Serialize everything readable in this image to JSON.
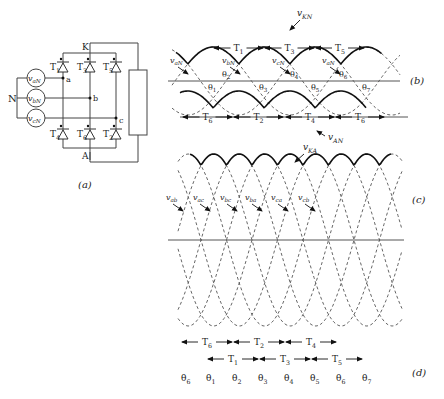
{
  "panels": {
    "a": {
      "caption": "(a)"
    },
    "b": {
      "caption": "(b)"
    },
    "c": {
      "caption": "(c)"
    },
    "d": {
      "caption": "(d)"
    }
  },
  "circuit": {
    "neutral_label": "N",
    "sources": [
      {
        "name": "v",
        "sub": "aN"
      },
      {
        "name": "v",
        "sub": "bN"
      },
      {
        "name": "v",
        "sub": "cN"
      }
    ],
    "nodes": {
      "a": "a",
      "b": "b",
      "c": "c",
      "K": "K",
      "A": "A"
    },
    "thyristors_top": [
      {
        "name": "T",
        "sub": "1"
      },
      {
        "name": "T",
        "sub": "3"
      },
      {
        "name": "T",
        "sub": "5"
      }
    ],
    "thyristors_bottom": [
      {
        "name": "T",
        "sub": "4"
      },
      {
        "name": "T",
        "sub": "6"
      },
      {
        "name": "T",
        "sub": "2"
      }
    ]
  },
  "panel_b": {
    "top_curve_label": {
      "name": "v",
      "sub": "KN"
    },
    "bottom_curve_label": {
      "name": "v",
      "sub": "AN"
    },
    "phase_labels": [
      {
        "name": "v",
        "sub": "aN"
      },
      {
        "name": "v",
        "sub": "bN"
      },
      {
        "name": "v",
        "sub": "cN"
      },
      {
        "name": "v",
        "sub": "aN"
      }
    ],
    "top_intervals": [
      {
        "name": "T",
        "sub": "1"
      },
      {
        "name": "T",
        "sub": "3"
      },
      {
        "name": "T",
        "sub": "5"
      }
    ],
    "bottom_intervals": [
      {
        "name": "T",
        "sub": "6"
      },
      {
        "name": "T",
        "sub": "2"
      },
      {
        "name": "T",
        "sub": "4"
      },
      {
        "name": "T",
        "sub": "6"
      }
    ],
    "theta_above_axis": [
      {
        "name": "θ",
        "sub": "2"
      },
      {
        "name": "θ",
        "sub": "4"
      },
      {
        "name": "θ",
        "sub": "6"
      }
    ],
    "theta_below_axis": [
      {
        "name": "θ",
        "sub": "1"
      },
      {
        "name": "θ",
        "sub": "3"
      },
      {
        "name": "θ",
        "sub": "5"
      },
      {
        "name": "θ",
        "sub": "7"
      }
    ]
  },
  "panel_c": {
    "output_label": {
      "name": "v",
      "sub": "KA"
    },
    "line_labels": [
      {
        "name": "v",
        "sub": "ab"
      },
      {
        "name": "v",
        "sub": "ac"
      },
      {
        "name": "v",
        "sub": "bc"
      },
      {
        "name": "v",
        "sub": "ba"
      },
      {
        "name": "v",
        "sub": "ca"
      },
      {
        "name": "v",
        "sub": "cb"
      }
    ]
  },
  "panel_d": {
    "row1": [
      {
        "name": "T",
        "sub": "6"
      },
      {
        "name": "T",
        "sub": "2"
      },
      {
        "name": "T",
        "sub": "4"
      }
    ],
    "row2": [
      {
        "name": "T",
        "sub": "1"
      },
      {
        "name": "T",
        "sub": "3"
      },
      {
        "name": "T",
        "sub": "5"
      }
    ],
    "thetas": [
      {
        "name": "θ",
        "sub": "6"
      },
      {
        "name": "θ",
        "sub": "1"
      },
      {
        "name": "θ",
        "sub": "2"
      },
      {
        "name": "θ",
        "sub": "3"
      },
      {
        "name": "θ",
        "sub": "4"
      },
      {
        "name": "θ",
        "sub": "5"
      },
      {
        "name": "θ",
        "sub": "6"
      },
      {
        "name": "θ",
        "sub": "7"
      }
    ]
  }
}
